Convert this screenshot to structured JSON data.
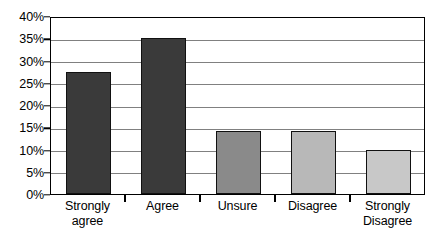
{
  "chart_data": {
    "type": "bar",
    "title": "",
    "subtitle": "",
    "xlabel": "",
    "ylabel": "",
    "categories": [
      "Strongly agree",
      "Agree",
      "Unsure",
      "Disagree",
      "Strongly Disagree"
    ],
    "category_lines": [
      [
        "Strongly",
        "agree"
      ],
      [
        "Agree"
      ],
      [
        "Unsure"
      ],
      [
        "Disagree"
      ],
      [
        "Strongly",
        "Disagree"
      ]
    ],
    "values": [
      27.5,
      35.0,
      14.2,
      14.2,
      10.0
    ],
    "value_labels": [
      "27.5%",
      "35%",
      "14.2%",
      "14.2%",
      "10%"
    ],
    "bar_colors": [
      "#3a3a3a",
      "#3a3a3a",
      "#8a8a8a",
      "#b8b8b8",
      "#c8c8c8"
    ],
    "bar_border_color": "#111111",
    "ylim": [
      0,
      40
    ],
    "ytick_values": [
      0,
      5,
      10,
      15,
      20,
      25,
      30,
      35,
      40
    ],
    "ytick_labels": [
      "0%",
      "5%",
      "10%",
      "15%",
      "20%",
      "25%",
      "30%",
      "35%",
      "40%"
    ],
    "grid": true,
    "grid_axis": "y",
    "grid_color": "#808080",
    "legend": false,
    "legend_position": "none",
    "frame_color": "#000000",
    "background_color": "#ffffff",
    "annotations": []
  }
}
